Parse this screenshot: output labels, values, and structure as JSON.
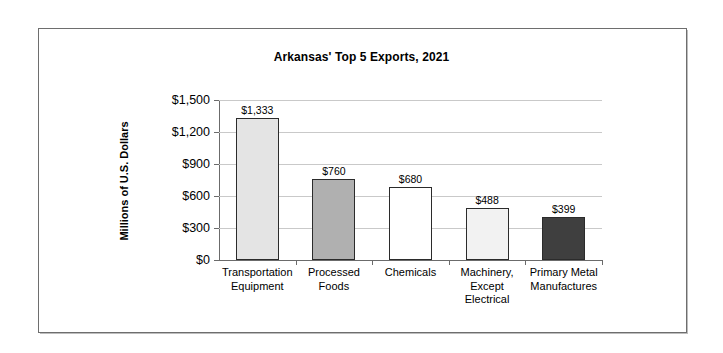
{
  "chart_data": {
    "type": "bar",
    "title": "Arkansas' Top 5 Exports, 2021",
    "xlabel": "",
    "ylabel": "Millions of U.S. Dollars",
    "categories": [
      "Transportation\nEquipment",
      "Processed\nFoods",
      "Chemicals",
      "Machinery,\nExcept\nElectrical",
      "Primary Metal\nManufactures"
    ],
    "values": [
      1333,
      760,
      680,
      488,
      399
    ],
    "value_labels": [
      "$1,333",
      "$760",
      "$680",
      "$488",
      "$399"
    ],
    "bar_colors": [
      "#e4e4e4",
      "#b0b0b0",
      "#ffffff",
      "#f2f2f2",
      "#3f3f3f"
    ],
    "bar_border_color": "#2b2b2b",
    "ylim": [
      0,
      1500
    ],
    "ytick_values": [
      0,
      300,
      600,
      900,
      1200,
      1500
    ],
    "ytick_labels": [
      "$0",
      "$300",
      "$600",
      "$900",
      "$1,200",
      "$1,500"
    ],
    "grid": true,
    "grid_color": "#c9c9c9",
    "legend": null,
    "legend_position": "none",
    "axis_color": "#6b6b6b",
    "frame_color": "#6e6e6e",
    "background": "#ffffff"
  }
}
